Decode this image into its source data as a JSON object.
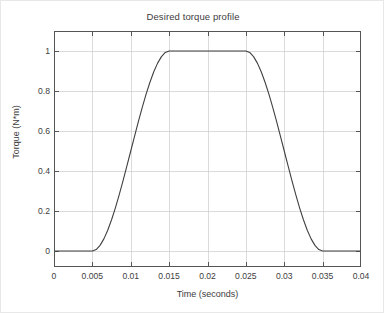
{
  "chart_data": {
    "type": "line",
    "title": "Desired torque profile",
    "xlabel": "Time (seconds)",
    "ylabel": "Torque (N*m)",
    "xlim": [
      0,
      0.04
    ],
    "ylim": [
      -0.08,
      1.1
    ],
    "grid": true,
    "legend": null,
    "xticks": [
      0,
      0.005,
      0.01,
      0.015,
      0.02,
      0.025,
      0.03,
      0.035,
      0.04
    ],
    "xtick_labels": [
      "0",
      "0.005",
      "0.01",
      "0.015",
      "0.02",
      "0.025",
      "0.03",
      "0.035",
      "0.04"
    ],
    "yticks": [
      0,
      0.2,
      0.4,
      0.6,
      0.8,
      1
    ],
    "ytick_labels": [
      "0",
      "0.2",
      "0.4",
      "0.6",
      "0.8",
      "1"
    ],
    "line_color": "#404040",
    "grid_color": "#cccccc",
    "axis_color": "#555555",
    "background_color": "#ffffff",
    "series": [
      {
        "name": "Desired torque",
        "x": [
          0,
          0.001,
          0.002,
          0.003,
          0.004,
          0.005,
          0.0055,
          0.006,
          0.0065,
          0.007,
          0.0075,
          0.008,
          0.0085,
          0.009,
          0.0095,
          0.01,
          0.0105,
          0.011,
          0.0115,
          0.012,
          0.0125,
          0.013,
          0.0135,
          0.014,
          0.0145,
          0.015,
          0.016,
          0.017,
          0.018,
          0.019,
          0.02,
          0.021,
          0.022,
          0.023,
          0.024,
          0.025,
          0.0255,
          0.026,
          0.0265,
          0.027,
          0.0275,
          0.028,
          0.0285,
          0.029,
          0.0295,
          0.03,
          0.0305,
          0.031,
          0.0315,
          0.032,
          0.0325,
          0.033,
          0.0335,
          0.034,
          0.0345,
          0.035,
          0.036,
          0.037,
          0.038,
          0.039,
          0.04
        ],
        "y": [
          0,
          0,
          0,
          0,
          0,
          0,
          0.00725,
          0.028,
          0.06075,
          0.104,
          0.15625,
          0.216,
          0.28175,
          0.352,
          0.42525,
          0.5,
          0.57475,
          0.648,
          0.71825,
          0.784,
          0.84375,
          0.896,
          0.93925,
          0.972,
          0.99275,
          1,
          1,
          1,
          1,
          1,
          1,
          1,
          1,
          1,
          1,
          1,
          0.99275,
          0.972,
          0.93925,
          0.896,
          0.84375,
          0.784,
          0.71825,
          0.648,
          0.57475,
          0.5,
          0.42525,
          0.352,
          0.28175,
          0.216,
          0.15625,
          0.104,
          0.06075,
          0.028,
          0.00725,
          0,
          0,
          0,
          0,
          0,
          0
        ]
      }
    ],
    "annotations": {
      "ramp_up_start": 0.005,
      "ramp_up_end": 0.015,
      "plateau_value": 1,
      "ramp_down_start": 0.025,
      "ramp_down_end": 0.035
    }
  }
}
